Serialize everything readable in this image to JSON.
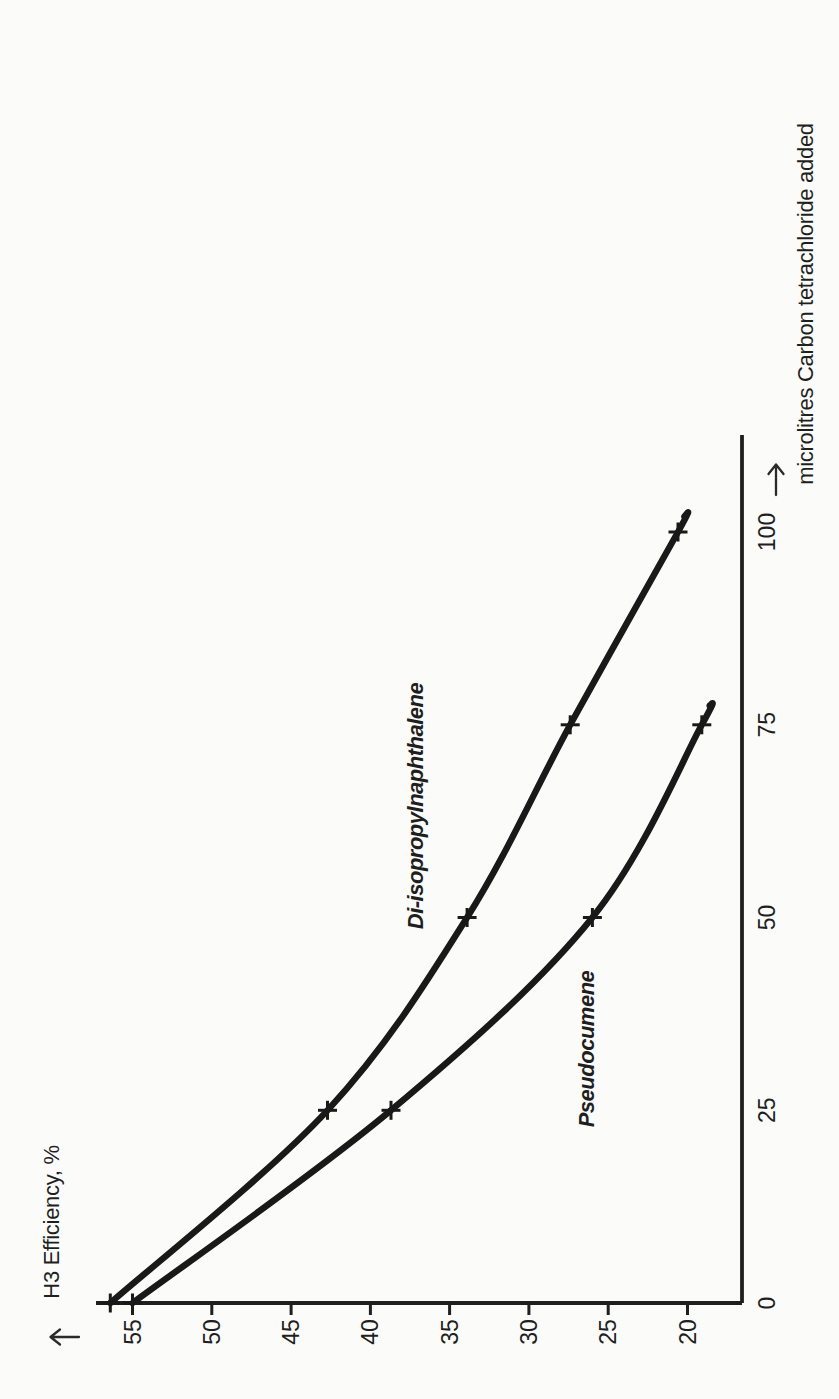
{
  "figure": {
    "background_color": "#fbfbfa",
    "ink_color": "#1f1f1f",
    "curve_color": "#191919"
  },
  "icons": {
    "efficiency_axis_arrow": "left-arrow (up-arrow of rotated y-axis)",
    "microlitres_axis_arrow": "up-arrow (right-arrow of rotated x-axis)"
  },
  "chart_data": {
    "type": "line",
    "title": "",
    "xlabel": "microlitres Carbon tetrachloride added",
    "ylabel": "H3 Efficiency, %",
    "x_ticks": [
      0,
      25,
      50,
      75,
      100
    ],
    "y_ticks": [
      55,
      50,
      45,
      40,
      35,
      30,
      25,
      20
    ],
    "xlim": [
      0,
      108
    ],
    "ylim": [
      17.5,
      58
    ],
    "grid": false,
    "marker": "plus",
    "legend_position": "inline labels beside curves",
    "orientation_note": "figure rotated 90deg CCW: microlitres axis runs bottom-to-top along right edge, efficiency axis runs left-to-right along bottom edge, all text reads bottom-to-top",
    "series": [
      {
        "name": "Di-isopropylnaphthalene",
        "x": [
          0,
          25,
          50,
          75,
          100
        ],
        "values": [
          56.4,
          42.7,
          33.9,
          27.4,
          20.6
        ],
        "tip": {
          "x": 102,
          "y": 20.2
        }
      },
      {
        "name": "Pseudocumene",
        "x": [
          0,
          25,
          50,
          75
        ],
        "values": [
          55.0,
          38.7,
          26.0,
          19.1
        ],
        "tip": {
          "x": 77.5,
          "y": 18.6
        }
      }
    ],
    "portrait_pixel_anchors": {
      "h_axis_y": 1303,
      "h_axis_left_x": 96,
      "v_axis_x": 742,
      "v_axis_top_y": 435,
      "eff55_x": 132.5,
      "eff20_x": 687.5,
      "ul0_y": 1303,
      "ul100_y": 532,
      "eff_tick_len": 12,
      "eff_label_cy": 1332,
      "ul_label_cx": 767,
      "axis_stroke": 3.8,
      "curve_stroke": 6.4,
      "tick_stroke": 3,
      "marker_arm": 9.5,
      "marker_stroke": 3,
      "tick_font_size": 23
    }
  }
}
